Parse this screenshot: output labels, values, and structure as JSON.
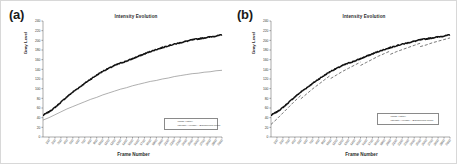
{
  "figure": {
    "panels": [
      {
        "id": "a",
        "label": "(a)",
        "title": "Intensity Evolution",
        "legend": [
          {
            "name": "series-observed",
            "text": "Image History"
          },
          {
            "name": "series-model",
            "text": "Intensity Average + Background Model"
          }
        ]
      },
      {
        "id": "b",
        "label": "(b)",
        "title": "Intensity Evolution",
        "legend": [
          {
            "name": "series-observed",
            "text": "Image History"
          },
          {
            "name": "series-model",
            "text": "Intensity Average + Background Model"
          }
        ]
      }
    ]
  },
  "chart_data": [
    {
      "type": "line",
      "panel": "a",
      "title": "Intensity Evolution",
      "xlabel": "Frame Number",
      "ylabel": "Gray Level",
      "ylim": [
        0,
        240
      ],
      "yticks": [
        0,
        20,
        40,
        60,
        80,
        100,
        120,
        140,
        160,
        180,
        200,
        220,
        240
      ],
      "grid": false,
      "xticks": [
        100,
        200,
        300,
        400,
        500,
        600,
        700,
        800,
        900,
        1000,
        1100,
        1200,
        1300,
        1400,
        1500,
        1600,
        1700,
        1800,
        1900,
        2000,
        2100,
        2200,
        2300,
        2400,
        2500,
        2600,
        2700,
        2800,
        2900,
        3000
      ],
      "x": [
        0,
        100,
        200,
        300,
        400,
        500,
        600,
        700,
        800,
        900,
        1000,
        1100,
        1200,
        1300,
        1400,
        1500,
        1600,
        1700,
        1800,
        1900,
        2000,
        2100,
        2200,
        2300,
        2400,
        2500,
        2600,
        2700,
        2800,
        2900,
        3000
      ],
      "series": [
        {
          "name": "Image History",
          "style": "solid-thick-noisy",
          "color": "#111111",
          "values": [
            45,
            52,
            61,
            72,
            83,
            93,
            102,
            111,
            120,
            128,
            136,
            142,
            148,
            153,
            157,
            162,
            167,
            172,
            177,
            181,
            185,
            189,
            192,
            195,
            198,
            201,
            203,
            205,
            207,
            209,
            211
          ]
        },
        {
          "name": "Intensity Average + Background Model",
          "style": "solid-thin",
          "color": "#8c8c8c",
          "values": [
            35,
            40,
            46,
            52,
            58,
            63,
            68,
            73,
            78,
            82,
            87,
            91,
            95,
            99,
            102,
            106,
            109,
            112,
            115,
            117,
            120,
            122,
            125,
            127,
            129,
            131,
            132,
            134,
            135,
            137,
            138
          ]
        }
      ]
    },
    {
      "type": "line",
      "panel": "b",
      "title": "Intensity Evolution",
      "xlabel": "Frame Number",
      "ylabel": "Gray Level",
      "ylim": [
        0,
        240
      ],
      "yticks": [
        0,
        20,
        40,
        60,
        80,
        100,
        120,
        140,
        160,
        180,
        200,
        220,
        240
      ],
      "grid": false,
      "xticks": [
        100,
        200,
        300,
        400,
        500,
        600,
        700,
        800,
        900,
        1000,
        1100,
        1200,
        1300,
        1400,
        1500,
        1600,
        1700,
        1800,
        1900,
        2000,
        2100,
        2200,
        2300,
        2400,
        2500,
        2600,
        2700,
        2800,
        2900,
        3000
      ],
      "x": [
        0,
        100,
        200,
        300,
        400,
        500,
        600,
        700,
        800,
        900,
        1000,
        1100,
        1200,
        1300,
        1400,
        1500,
        1600,
        1700,
        1800,
        1900,
        2000,
        2100,
        2200,
        2300,
        2400,
        2500,
        2600,
        2700,
        2800,
        2900,
        3000
      ],
      "series": [
        {
          "name": "Image History",
          "style": "solid-thick-noisy",
          "color": "#111111",
          "values": [
            45,
            52,
            61,
            72,
            83,
            93,
            102,
            111,
            120,
            128,
            136,
            142,
            148,
            153,
            157,
            162,
            167,
            172,
            177,
            181,
            185,
            189,
            192,
            195,
            198,
            201,
            203,
            205,
            207,
            209,
            211
          ]
        },
        {
          "name": "Intensity Average + Background Model",
          "style": "dashed-piecewise",
          "color": "#555555",
          "values": [
            33,
            43,
            54,
            65,
            76,
            86,
            95,
            104,
            112,
            120,
            128,
            134,
            140,
            145,
            150,
            155,
            160,
            165,
            170,
            174,
            178,
            182,
            185,
            188,
            191,
            194,
            196,
            199,
            201,
            203,
            205
          ]
        }
      ]
    }
  ]
}
